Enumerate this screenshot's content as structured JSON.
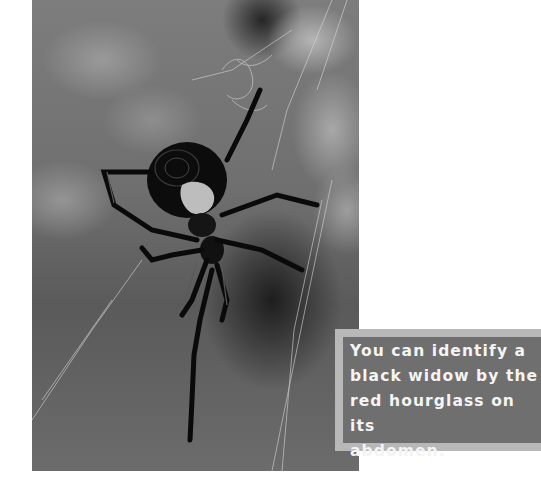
{
  "photo": {
    "subject": "black widow spider on web",
    "style": "black-and-white photograph"
  },
  "caption": {
    "lines": [
      "You can identify a",
      "black widow by the",
      "red hourglass on its",
      "abdomen."
    ],
    "text": "You can identify a black widow by the red hourglass on its abdomen."
  },
  "colors": {
    "caption_box": "#6f6f6f",
    "caption_frame": "#b8b8b8",
    "caption_text": "#f4f4f4",
    "page_background": "#ffffff"
  }
}
